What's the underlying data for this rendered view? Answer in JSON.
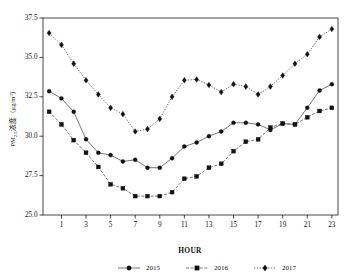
{
  "chart_data": {
    "type": "line",
    "title": "",
    "xlabel": "HOUR",
    "ylabel": "PM2.5浓度（μg/m³）",
    "ylabel_parts": {
      "prefix": "PM",
      "subscript": "2.5",
      "suffix": "浓度（μg/m",
      "superscript": "3",
      "tail": "）"
    },
    "x": [
      0,
      1,
      2,
      3,
      4,
      5,
      6,
      7,
      8,
      9,
      10,
      11,
      12,
      13,
      14,
      15,
      16,
      17,
      18,
      19,
      20,
      21,
      22,
      23
    ],
    "xtick_labels": [
      "1",
      "3",
      "5",
      "7",
      "9",
      "11",
      "13",
      "15",
      "17",
      "19",
      "21",
      "23"
    ],
    "xtick_values": [
      1,
      3,
      5,
      7,
      9,
      11,
      13,
      15,
      17,
      19,
      21,
      23
    ],
    "xlim": [
      -0.5,
      23.5
    ],
    "ytick_labels": [
      "25.0",
      "27.5",
      "30.0",
      "32.5",
      "35.0",
      "37.5"
    ],
    "ytick_values": [
      25.0,
      27.5,
      30.0,
      32.5,
      35.0,
      37.5
    ],
    "ylim": [
      25.0,
      37.5
    ],
    "grid": false,
    "legend_position": "bottom",
    "series": [
      {
        "name": "2015",
        "marker": "circle",
        "linestyle": "solid",
        "color": "#111111",
        "values": [
          32.85,
          32.4,
          31.55,
          29.8,
          28.95,
          28.8,
          28.4,
          28.5,
          28.0,
          28.0,
          28.6,
          29.35,
          29.6,
          30.0,
          30.3,
          30.85,
          30.85,
          30.75,
          30.4,
          30.8,
          30.75,
          31.8,
          32.9,
          33.3
        ]
      },
      {
        "name": "2016",
        "marker": "square",
        "linestyle": "dashed",
        "color": "#111111",
        "values": [
          31.55,
          30.75,
          29.75,
          28.95,
          28.05,
          26.95,
          26.7,
          26.2,
          26.2,
          26.2,
          26.45,
          27.3,
          27.45,
          28.0,
          28.25,
          29.05,
          29.65,
          29.8,
          30.55,
          30.8,
          30.75,
          31.2,
          31.6,
          31.8
        ]
      },
      {
        "name": "2017",
        "marker": "diamond",
        "linestyle": "dotted",
        "color": "#111111",
        "values": [
          36.55,
          35.8,
          34.6,
          33.55,
          32.65,
          31.8,
          31.4,
          30.3,
          30.45,
          31.1,
          32.5,
          33.55,
          33.6,
          33.25,
          32.8,
          33.3,
          33.15,
          32.65,
          33.15,
          33.85,
          34.6,
          35.2,
          36.3,
          36.8
        ]
      }
    ]
  },
  "legend": {
    "items": [
      {
        "label": "2015"
      },
      {
        "label": "2016"
      },
      {
        "label": "2017"
      }
    ]
  }
}
